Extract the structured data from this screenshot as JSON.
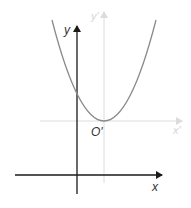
{
  "diagram": {
    "type": "coordinate-translation",
    "curve": "parabola",
    "labels": {
      "main_y_axis": "y",
      "main_x_axis": "x",
      "new_y_axis": "y'",
      "new_x_axis": "x'",
      "new_origin": "O'"
    },
    "colors": {
      "main_axes": "#1a1a1a",
      "new_axes": "#d9d9d9",
      "new_axis_labels": "#d0d0d0",
      "curve": "#8a8a8a",
      "text": "#333333"
    }
  }
}
